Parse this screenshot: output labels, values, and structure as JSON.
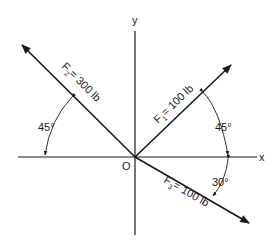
{
  "axes": {
    "x_label": "x",
    "y_label": "y",
    "origin_label": "O"
  },
  "forces": [
    {
      "name": "F",
      "subscript": "1",
      "value": "= 100 lb",
      "angle_deg": 45,
      "direction": "up-right"
    },
    {
      "name": "F",
      "subscript": "2",
      "value": "= 300 lb",
      "angle_deg": 135,
      "direction": "up-left"
    },
    {
      "name": "F",
      "subscript": "3",
      "value": "= 100 lb",
      "angle_deg": -30,
      "direction": "down-right"
    }
  ],
  "angles": [
    {
      "label": "45°",
      "between": "F2 and negative x-axis"
    },
    {
      "label": "45°",
      "between": "F1 and positive x-axis"
    },
    {
      "label": "30°",
      "between": "F3 and positive x-axis"
    }
  ],
  "colors": {
    "ink": "#1a1a1a",
    "background": "#ffffff"
  }
}
